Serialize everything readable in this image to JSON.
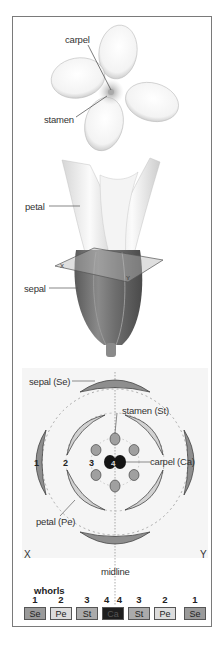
{
  "top_flower": {
    "labels": {
      "carpel": "carpel",
      "stamen": "stamen"
    }
  },
  "bud": {
    "labels": {
      "petal": "petal",
      "sepal": "sepal"
    },
    "plane_labels": {
      "x": "X",
      "y": "Y"
    }
  },
  "floral_diagram": {
    "labels": {
      "sepal": "sepal (Se)",
      "stamen": "stamen (St)",
      "carpel": "carpel (Ca)",
      "petal": "petal (Pe)",
      "midline": "midline",
      "x": "X",
      "y": "Y"
    },
    "whorl_numbers": {
      "w1": "1",
      "w2": "2",
      "w3": "3",
      "w4": "4"
    }
  },
  "whorls": {
    "title": "whorls",
    "items": [
      {
        "num": "1",
        "abbr": "Se",
        "color": "#9a9a9a",
        "text": "#222222"
      },
      {
        "num": "2",
        "abbr": "Pe",
        "color": "#dcdcdc",
        "text": "#222222"
      },
      {
        "num": "3",
        "abbr": "St",
        "color": "#ababab",
        "text": "#222222"
      },
      {
        "num": "4",
        "abbr": "4",
        "color": "",
        "text": ""
      },
      {
        "num": "4",
        "abbr": "Ca",
        "color": "#1e1e1e",
        "text": "#555555"
      },
      {
        "num": "3",
        "abbr": "St",
        "color": "#ababab",
        "text": "#222222"
      },
      {
        "num": "2",
        "abbr": "Pe",
        "color": "#dcdcdc",
        "text": "#222222"
      },
      {
        "num": "1",
        "abbr": "Se",
        "color": "#9a9a9a",
        "text": "#222222"
      }
    ]
  },
  "colors": {
    "sepal": "#8e8e8e",
    "petal": "#d2d2d2",
    "stamen": "#a0a0a0",
    "carpel": "#151515",
    "panel_bg": "#f4f4f4"
  }
}
